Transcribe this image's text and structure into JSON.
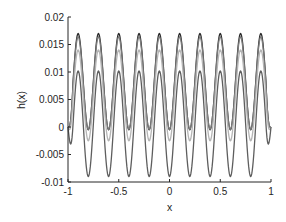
{
  "chart_data": {
    "type": "line",
    "title": "",
    "xlabel": "x",
    "ylabel": "h(x)",
    "xlim": [
      -1,
      1
    ],
    "ylim": [
      -0.01,
      0.02
    ],
    "xticks": [
      -1,
      -0.5,
      0,
      0.5,
      1
    ],
    "xtick_labels": [
      "-1",
      "-0.5",
      "0",
      "0.5",
      "1"
    ],
    "yticks": [
      -0.01,
      -0.005,
      0,
      0.005,
      0.01,
      0.015,
      0.02
    ],
    "ytick_labels": [
      "-0.01",
      "-0.005",
      "0",
      "0.005",
      "0.01",
      "0.015",
      "0.02"
    ],
    "grid": false,
    "legend": null,
    "x_step": 0.025,
    "series": [
      {
        "name": "curve-1",
        "color": "#2b2b2b",
        "peak": 0.017,
        "trough": -0.0005,
        "period": 0.2,
        "first_peak_x": -0.9
      },
      {
        "name": "curve-2",
        "color": "#7a7a7a",
        "peak": 0.0164,
        "trough": -0.0004,
        "period": 0.2,
        "first_peak_x": -0.9
      },
      {
        "name": "curve-3",
        "color": "#b5b5b5",
        "peak": 0.014,
        "trough": -0.0025,
        "period": 0.2,
        "first_peak_x": -0.9
      },
      {
        "name": "curve-4",
        "color": "#5e5e5e",
        "peak": 0.0102,
        "trough": -0.009,
        "period": 0.2,
        "first_peak_x": -0.9
      }
    ]
  },
  "axes": {
    "xlabel": "x",
    "ylabel": "h(x)"
  }
}
